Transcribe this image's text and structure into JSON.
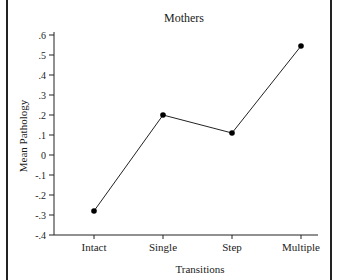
{
  "chart_data": {
    "type": "line",
    "title": "Mothers",
    "xlabel": "Transitions",
    "ylabel": "Mean Pathology",
    "categories": [
      "Intact",
      "Single",
      "Step",
      "Multiple"
    ],
    "series": [
      {
        "name": "Mothers",
        "values": [
          -0.28,
          0.2,
          0.11,
          0.545
        ]
      }
    ],
    "ylim": [
      -0.4,
      0.6
    ],
    "yticks": [
      0.6,
      0.5,
      0.4,
      0.3,
      0.2,
      0.1,
      0.0,
      -0.1,
      -0.2,
      -0.3,
      -0.4
    ],
    "ytick_labels": [
      ".6",
      ".5",
      ".4",
      ".3",
      ".2",
      ".1",
      "0",
      "-.1",
      "-.2",
      "-.3",
      "-.4"
    ],
    "grid": false,
    "legend": "none",
    "markers": "filled-circle",
    "line_color": "#222222"
  }
}
